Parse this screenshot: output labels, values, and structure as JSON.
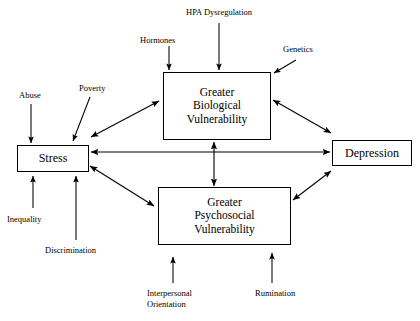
{
  "diagram": {
    "stroke_color": "#000000",
    "background_color": "#ffffff",
    "nodes": [
      {
        "id": "stress",
        "label": "Stress"
      },
      {
        "id": "biological",
        "label": "Greater\nBiological\nVulnerability"
      },
      {
        "id": "psychosocial",
        "label": "Greater\nPsychosocial\nVulnerability"
      },
      {
        "id": "depression",
        "label": "Depression"
      }
    ],
    "external_labels": [
      {
        "id": "hpa",
        "label": "HPA Dysregulation"
      },
      {
        "id": "hormones",
        "label": "Hormones"
      },
      {
        "id": "genetics",
        "label": "Genetics"
      },
      {
        "id": "abuse",
        "label": "Abuse"
      },
      {
        "id": "poverty",
        "label": "Poverty"
      },
      {
        "id": "inequality",
        "label": "Inequality"
      },
      {
        "id": "discrimination",
        "label": "Discrimination"
      },
      {
        "id": "interpersonal",
        "label": "Interpersonal\nOrientation"
      },
      {
        "id": "rumination",
        "label": "Rumination"
      }
    ],
    "edges": [
      {
        "id": "stress-biological",
        "from": "stress",
        "to": "biological",
        "heads": "both"
      },
      {
        "id": "stress-depression",
        "from": "stress",
        "to": "depression",
        "heads": "both"
      },
      {
        "id": "stress-psychosocial",
        "from": "stress",
        "to": "psychosocial",
        "heads": "both"
      },
      {
        "id": "biological-depression",
        "from": "biological",
        "to": "depression",
        "heads": "both"
      },
      {
        "id": "psychosocial-depression",
        "from": "psychosocial",
        "to": "depression",
        "heads": "both"
      },
      {
        "id": "biological-psychosocial",
        "from": "biological",
        "to": "psychosocial",
        "heads": "both"
      },
      {
        "id": "hpa-biological",
        "from": "hpa",
        "to": "biological",
        "heads": "single"
      },
      {
        "id": "hormones-biological",
        "from": "hormones",
        "to": "biological",
        "heads": "single"
      },
      {
        "id": "genetics-biological",
        "from": "genetics",
        "to": "biological",
        "heads": "single"
      },
      {
        "id": "abuse-stress",
        "from": "abuse",
        "to": "stress",
        "heads": "single"
      },
      {
        "id": "poverty-stress",
        "from": "poverty",
        "to": "stress",
        "heads": "single"
      },
      {
        "id": "inequality-stress",
        "from": "inequality",
        "to": "stress",
        "heads": "single"
      },
      {
        "id": "discrimination-stress",
        "from": "discrimination",
        "to": "stress",
        "heads": "single"
      },
      {
        "id": "interpersonal-psych",
        "from": "interpersonal",
        "to": "psychosocial",
        "heads": "single"
      },
      {
        "id": "rumination-psych",
        "from": "rumination",
        "to": "psychosocial",
        "heads": "single"
      }
    ]
  }
}
